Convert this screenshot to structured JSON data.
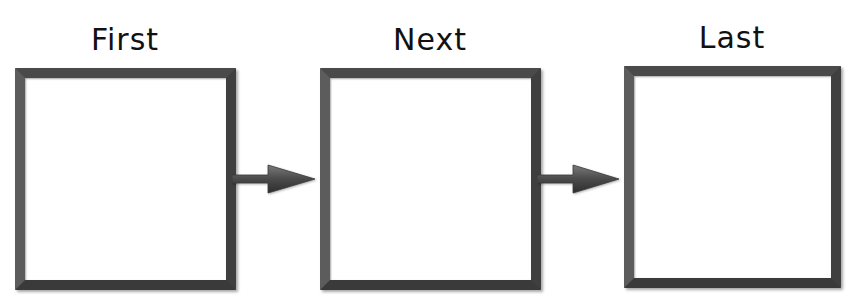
{
  "diagram": {
    "type": "sequence-flow",
    "colors": {
      "frame": "#4a4a4a",
      "arrow": "#555555",
      "text": "#111111",
      "background": "#ffffff"
    },
    "steps": [
      {
        "label": "First",
        "content": ""
      },
      {
        "label": "Next",
        "content": ""
      },
      {
        "label": "Last",
        "content": ""
      }
    ],
    "connectors": [
      {
        "from": "First",
        "to": "Next",
        "icon": "right-arrow-icon"
      },
      {
        "from": "Next",
        "to": "Last",
        "icon": "right-arrow-icon"
      }
    ]
  }
}
